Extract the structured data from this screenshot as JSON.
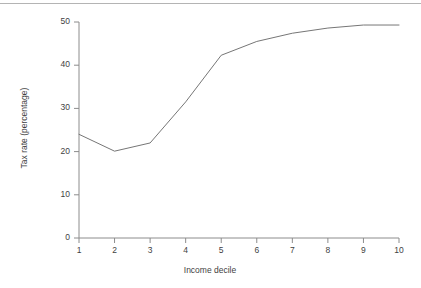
{
  "chart_data": {
    "type": "line",
    "title": "",
    "subtitle": "",
    "xlabel": "Income decile",
    "ylabel": "Tax rate (percentage)",
    "x": [
      1,
      2,
      3,
      4,
      5,
      6,
      7,
      8,
      9,
      10
    ],
    "values": [
      24.0,
      20.1,
      22.0,
      31.5,
      42.3,
      45.5,
      47.4,
      48.6,
      49.3,
      49.3
    ],
    "series": [
      {
        "name": "Tax rate",
        "values": [
          24.0,
          20.1,
          22.0,
          31.5,
          42.3,
          45.5,
          47.4,
          48.6,
          49.3,
          49.3
        ]
      }
    ],
    "xtick_labels": [
      "1",
      "2",
      "3",
      "4",
      "5",
      "6",
      "7",
      "8",
      "9",
      "10"
    ],
    "ytick_labels": [
      "0",
      "10",
      "20",
      "30",
      "40",
      "50"
    ],
    "ytick_values": [
      0,
      10,
      20,
      30,
      40,
      50
    ],
    "xlim": [
      1,
      10
    ],
    "ylim": [
      0,
      50
    ],
    "grid": false,
    "legend": false,
    "legend_position": "none",
    "line_color": "#767676",
    "axis_color": "#8c8c8c",
    "text_color": "#3f3f3f",
    "background_color": "#ffffff",
    "annotations": []
  },
  "decoration": {
    "top_rule_color": "#b4b4b4"
  }
}
